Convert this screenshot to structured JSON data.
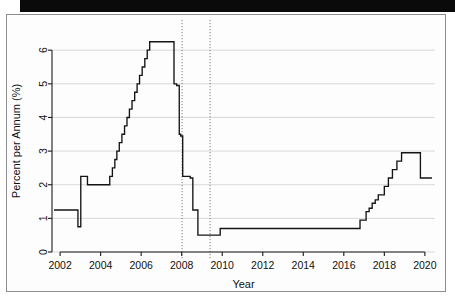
{
  "figure": {
    "accent_color": "#141414",
    "grid_color": "#c9c9c9",
    "event_line_color": "#6e6e6e"
  },
  "axes": {
    "x_title": "Year",
    "y_title": "Percent per Annum (%)",
    "x_ticks": [
      "2002",
      "2004",
      "2006",
      "2008",
      "2010",
      "2012",
      "2014",
      "2016",
      "2018",
      "2020"
    ],
    "y_ticks": [
      "0",
      "1",
      "2",
      "3",
      "4",
      "5",
      "6"
    ]
  },
  "chart_data": {
    "type": "line",
    "title": "",
    "subtitle": "",
    "xlabel": "Year",
    "ylabel": "Percent per Annum (%)",
    "xlim": [
      2001.6,
      2020.5
    ],
    "ylim": [
      0,
      6.6
    ],
    "x_ticks": [
      2002,
      2004,
      2006,
      2008,
      2010,
      2012,
      2014,
      2016,
      2018,
      2020
    ],
    "y_ticks": [
      0,
      1,
      2,
      3,
      4,
      5,
      6
    ],
    "grid": "horizontal",
    "legend": "none",
    "interpolation": "step-after",
    "series": [
      {
        "name": "Policy Rate",
        "x": [
          2001.7,
          2002.85,
          2002.88,
          2002.92,
          2003.02,
          2003.1,
          2003.35,
          2003.45,
          2004.32,
          2004.45,
          2004.58,
          2004.7,
          2004.8,
          2004.92,
          2005.05,
          2005.18,
          2005.3,
          2005.42,
          2005.55,
          2005.68,
          2005.8,
          2005.92,
          2006.05,
          2006.18,
          2006.3,
          2006.42,
          2006.55,
          2007.5,
          2007.62,
          2007.75,
          2007.88,
          2007.95,
          2008.05,
          2008.18,
          2008.3,
          2008.42,
          2008.55,
          2008.68,
          2008.8,
          2008.92,
          2009.9,
          2015.85,
          2016.8,
          2016.95,
          2017.1,
          2017.25,
          2017.4,
          2017.55,
          2017.7,
          2017.85,
          2018.0,
          2018.2,
          2018.4,
          2018.62,
          2018.85,
          2019.55,
          2019.78,
          2020.35
        ],
        "y": [
          1.25,
          1.25,
          0.75,
          0.75,
          2.25,
          2.25,
          2.0,
          2.0,
          2.0,
          2.25,
          2.5,
          2.75,
          3.0,
          3.25,
          3.5,
          3.75,
          4.0,
          4.25,
          4.5,
          4.75,
          5.0,
          5.25,
          5.5,
          5.75,
          6.0,
          6.25,
          6.25,
          6.25,
          5.0,
          4.95,
          3.5,
          3.45,
          2.25,
          2.25,
          2.25,
          2.2,
          1.25,
          1.25,
          0.5,
          0.5,
          0.7,
          0.7,
          0.95,
          0.95,
          1.2,
          1.3,
          1.45,
          1.55,
          1.7,
          1.7,
          1.95,
          2.2,
          2.45,
          2.7,
          2.95,
          2.95,
          2.2,
          2.2
        ]
      }
    ],
    "annotations": [
      {
        "type": "vline",
        "label": "reference-line-1",
        "x": 2008.02,
        "style": "dotted"
      },
      {
        "type": "vline",
        "label": "reference-line-2",
        "x": 2009.4,
        "style": "dotted"
      }
    ]
  }
}
